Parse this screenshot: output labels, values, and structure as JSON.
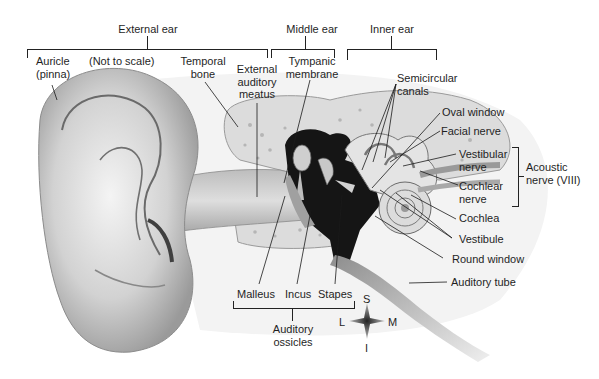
{
  "diagram": {
    "type": "anatomical-illustration",
    "regions": [
      {
        "id": "external",
        "label": "External ear"
      },
      {
        "id": "middle",
        "label": "Middle ear"
      },
      {
        "id": "inner",
        "label": "Inner ear"
      }
    ],
    "note": "(Not to scale)",
    "labels": {
      "auricle": [
        "Auricle",
        "(pinna)"
      ],
      "temporal_bone": [
        "Temporal",
        "bone"
      ],
      "external_auditory_meatus": [
        "External",
        "auditory",
        "meatus"
      ],
      "tympanic_membrane": [
        "Tympanic",
        "membrane"
      ],
      "semicircular_canals": [
        "Semicircular",
        "canals"
      ],
      "oval_window": "Oval window",
      "facial_nerve": "Facial nerve",
      "vestibular_nerve": [
        "Vestibular",
        "nerve"
      ],
      "cochlear_nerve": [
        "Cochlear",
        "nerve"
      ],
      "acoustic_nerve": [
        "Acoustic",
        "nerve (VIII)"
      ],
      "cochlea": "Cochlea",
      "vestibule": "Vestibule",
      "round_window": "Round window",
      "auditory_tube": "Auditory tube",
      "malleus": "Malleus",
      "incus": "Incus",
      "stapes": "Stapes",
      "auditory_ossicles": [
        "Auditory",
        "ossicles"
      ]
    },
    "compass": {
      "superior": "S",
      "inferior": "I",
      "lateral": "L",
      "medial": "M"
    }
  }
}
